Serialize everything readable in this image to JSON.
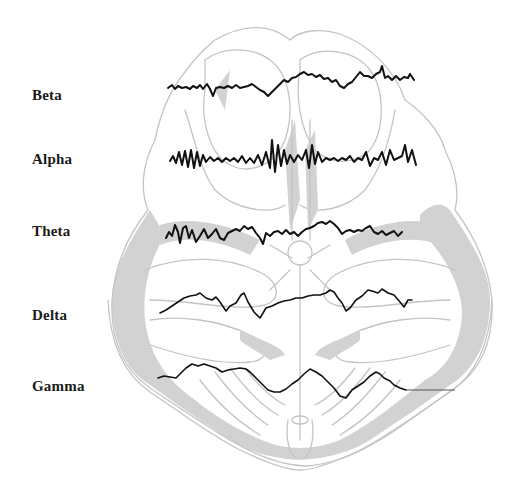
{
  "figure": {
    "colors": {
      "background": "#ffffff",
      "brain_outline": "#c4c4c4",
      "brain_shading": "#d2d2d2",
      "wave_trace": "#111111",
      "label_text": "#1a1a1a"
    },
    "waves": [
      {
        "label": "Beta",
        "character": "low amplitude, high frequency"
      },
      {
        "label": "Alpha",
        "character": "medium amplitude, regular bursts"
      },
      {
        "label": "Theta",
        "character": "medium amplitude, lower frequency"
      },
      {
        "label": "Delta",
        "character": "slow, larger undulations"
      },
      {
        "label": "Gamma",
        "character": "slow large undulations ending in flat line"
      }
    ]
  }
}
